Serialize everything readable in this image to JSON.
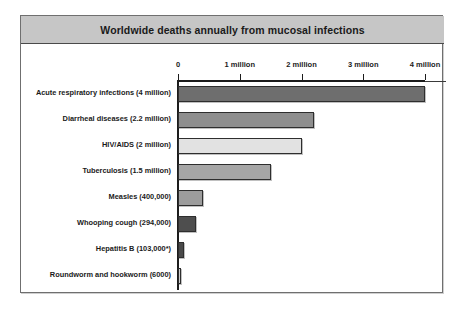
{
  "chart_data": {
    "type": "bar",
    "orientation": "horizontal",
    "title": "Worldwide deaths annually from mucosal infections",
    "xlabel": "",
    "ylabel": "",
    "xlim": [
      0,
      4400000
    ],
    "grid": false,
    "legend": null,
    "axis_tick_labels": [
      "0",
      "1 million",
      "2 million",
      "3 million",
      "4 million"
    ],
    "axis_tick_values": [
      0,
      1000000,
      2000000,
      3000000,
      4000000
    ],
    "categories": [
      "Acute respiratory infections (4 million)",
      "Diarrheal diseases (2.2 million)",
      "HIV/AIDS (2 million)",
      "Tuberculosis (1.5 million)",
      "Measles (400,000)",
      "Whooping cough (294,000)",
      "Hepatitis B (103,000*)",
      "Roundworm and hookworm (6000)"
    ],
    "values": [
      4000000,
      2200000,
      2000000,
      1500000,
      400000,
      294000,
      103000,
      6000
    ],
    "value_labels": [
      "4 million",
      "2.2 million",
      "2 million",
      "1.5 million",
      "400,000",
      "294,000",
      "103,000*",
      "6000"
    ],
    "bar_colors": [
      "#6e6e6e",
      "#8e8e8e",
      "#e2e2e2",
      "#a6a6a6",
      "#9d9d9d",
      "#4e4e4e",
      "#4a4a4a",
      "#cfcfcf"
    ]
  },
  "frame": {
    "border_color": "#6f6f6f",
    "title_bar_color": "#c6c6c6"
  }
}
